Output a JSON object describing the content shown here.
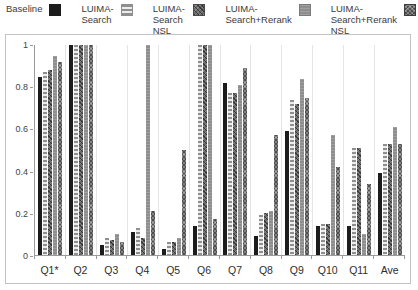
{
  "legend": {
    "items": [
      {
        "line1": "Baseline",
        "line2": "",
        "pattern": "solid",
        "color": "#1c1c1c"
      },
      {
        "line1": "LUIMA-",
        "line2": "Search",
        "pattern": "hstripe",
        "color": "#8f8f8f"
      },
      {
        "line1": "LUIMA-",
        "line2": "Search NSL",
        "pattern": "checker",
        "color": "#6a6a6a"
      },
      {
        "line1": "LUIMA-",
        "line2": "Search+Rerank",
        "pattern": "gray",
        "color": "#8e8e8e"
      },
      {
        "line1": "LUIMA-",
        "line2": "Search+Rerank NSL",
        "pattern": "crosshatch",
        "color": "#4e4e4e"
      }
    ]
  },
  "chart_data": {
    "type": "bar",
    "title": "",
    "xlabel": "",
    "ylabel": "",
    "categories": [
      "Q1*",
      "Q2",
      "Q3",
      "Q4",
      "Q5",
      "Q6",
      "Q7",
      "Q8",
      "Q9",
      "Q10",
      "Q11",
      "Ave"
    ],
    "series": [
      {
        "name": "Baseline",
        "pattern": "solid",
        "values": [
          0.85,
          1.0,
          0.05,
          0.11,
          0.03,
          0.14,
          0.82,
          0.09,
          0.59,
          0.14,
          0.14,
          0.39
        ]
      },
      {
        "name": "LUIMA-Search",
        "pattern": "hstripe",
        "values": [
          0.87,
          1.0,
          0.08,
          0.13,
          0.06,
          1.0,
          0.77,
          0.19,
          0.74,
          0.15,
          0.51,
          0.53
        ]
      },
      {
        "name": "LUIMA-Search NSL",
        "pattern": "checker",
        "values": [
          0.88,
          1.0,
          0.07,
          0.08,
          0.06,
          1.0,
          0.77,
          0.2,
          0.72,
          0.15,
          0.51,
          0.53
        ]
      },
      {
        "name": "LUIMA-Search+Rerank",
        "pattern": "gray",
        "values": [
          0.95,
          1.0,
          0.1,
          1.0,
          0.08,
          1.0,
          0.81,
          0.21,
          0.84,
          0.57,
          0.1,
          0.61
        ]
      },
      {
        "name": "LUIMA-Search+Rerank NSL",
        "pattern": "crosshatch",
        "values": [
          0.92,
          1.0,
          0.06,
          0.21,
          0.5,
          0.17,
          0.89,
          0.57,
          0.75,
          0.42,
          0.34,
          0.53
        ]
      }
    ],
    "ylim": [
      0,
      1
    ],
    "yticks": [
      0,
      0.2,
      0.4,
      0.6,
      0.8,
      1
    ],
    "ytick_labels": [
      "0",
      "0.2",
      "0.4",
      "0.6",
      "0.8",
      "1"
    ],
    "grid": "vertical-between-groups",
    "legend_position": "top"
  }
}
